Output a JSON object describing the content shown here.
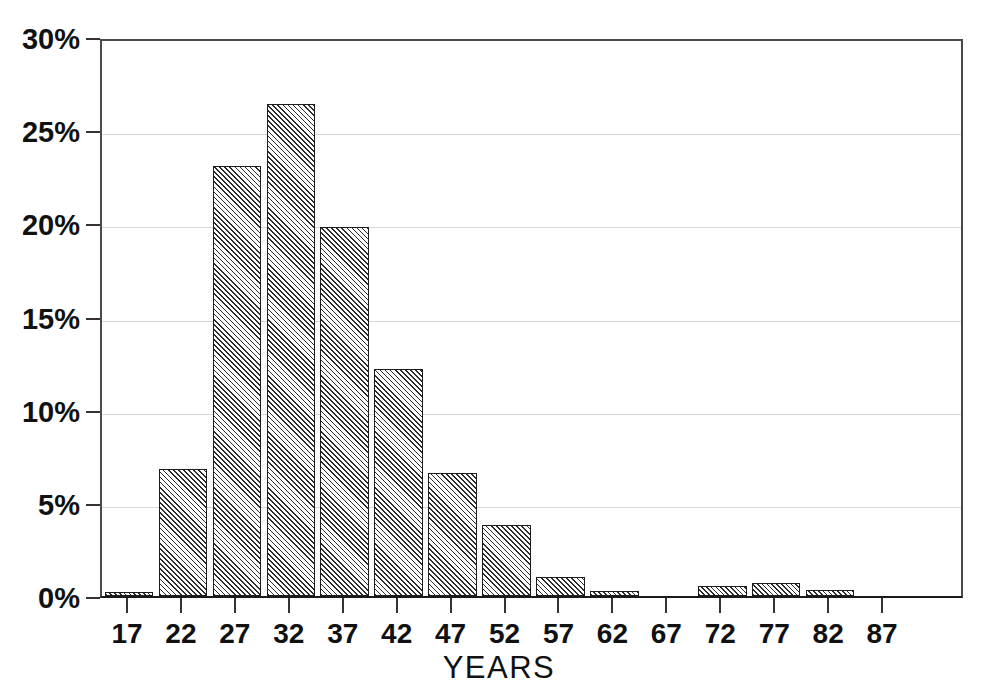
{
  "chart_data": {
    "type": "bar",
    "title": "",
    "subtitle": "",
    "xlabel": "YEARS",
    "ylabel": "",
    "categories": [
      "17",
      "22",
      "27",
      "32",
      "37",
      "42",
      "47",
      "52",
      "57",
      "62",
      "67",
      "72",
      "77",
      "82",
      "87"
    ],
    "values": [
      0.2,
      6.8,
      23.1,
      26.4,
      19.8,
      12.2,
      6.6,
      3.8,
      1.0,
      0.25,
      0.0,
      0.55,
      0.7,
      0.3,
      0.0
    ],
    "value_unit": "%",
    "ylim": [
      0,
      30
    ],
    "ytick_values": [
      0,
      5,
      10,
      15,
      20,
      25,
      30
    ],
    "ytick_labels": [
      "0%",
      "5%",
      "10%",
      "15%",
      "20%",
      "25%",
      "30%"
    ],
    "xtick_labels": [
      "17",
      "22",
      "27",
      "32",
      "37",
      "42",
      "47",
      "52",
      "57",
      "62",
      "67",
      "72",
      "77",
      "82",
      "87"
    ],
    "grid": true,
    "grid_axis": "y",
    "legend": null,
    "legend_position": "none",
    "bar_fill": "diagonal-hatch",
    "bar_edge_color": "#1c1c1c",
    "grid_color": "#d8d8d8",
    "axis_color": "#333333",
    "text_color": "#111111",
    "background": "#ffffff",
    "annotations": []
  },
  "axis": {
    "x_title": "YEARS"
  }
}
